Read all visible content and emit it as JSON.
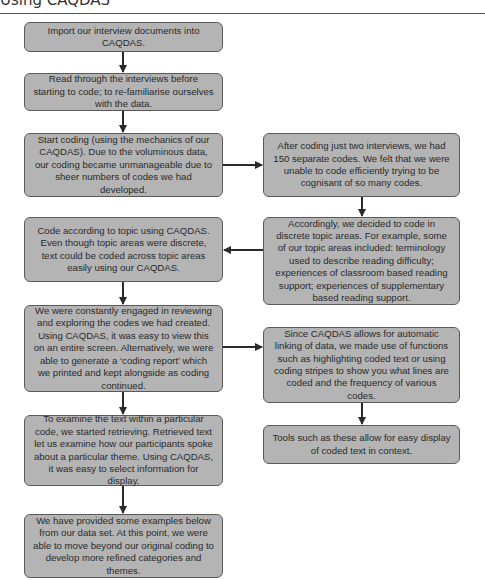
{
  "header": {
    "title": "Using CAQDAS"
  },
  "diagram": {
    "left_steps": [
      {
        "text": "Import our interview documents into CAQDAS."
      },
      {
        "text": "Read through the interviews before starting to code; to re-familiarise ourselves with the data."
      },
      {
        "text": "Start coding (using the mechanics of our CAQDAS). Due to the voluminous data, our coding became unmanageable due to sheer numbers of codes we had developed."
      },
      {
        "text": "Code according to topic using CAQDAS. Even though topic areas were discrete, text could be coded across topic areas easily using our CAQDAS."
      },
      {
        "text": "We were constantly engaged in reviewing and exploring the codes we had created. Using CAQDAS, it was easy to view this on an entire screen. Alternatively, we were able to generate a ‘coding report’ which we printed and kept alongside as coding continued."
      },
      {
        "text": "To examine the text within a particular code, we started retrieving. Retrieved text let us examine how our participants spoke about a particular theme. Using CAQDAS, it was easy to select information for display."
      },
      {
        "text": "We have provided some examples below from our data set. At this point, we were able to move beyond our original coding to develop more refined categories and themes."
      }
    ],
    "right_steps": [
      {
        "text": "After coding just two interviews, we had 150 separate codes. We felt that we were unable to code efficiently trying to be cognisant of so many codes."
      },
      {
        "text": "Accordingly, we decided to code in discrete topic areas. For example, some of our topic areas included: terminology used to describe reading difficulty; experiences of classroom based reading support; experiences of supplementary based reading support."
      },
      {
        "text": "Since CAQDAS allows for automatic linking of data, we made use of functions such as highlighting coded text or using coding stripes to show you what lines are coded and the frequency of various codes."
      },
      {
        "text": "Tools such as these allow for easy display of coded text in context."
      }
    ],
    "colors": {
      "box_fill": "#b4b4b4",
      "box_border": "#5a5a5a",
      "arrow": "#2a2a2a"
    }
  }
}
